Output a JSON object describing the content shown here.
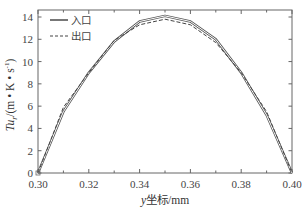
{
  "chart_data": {
    "type": "line",
    "title": "",
    "xlabel": "y坐标/mm",
    "xlabel_italic_prefix": "y",
    "xlabel_rest": "坐标/mm",
    "ylabel": "Tu_r/(m·K·s⁻¹)",
    "ylabel_parts": {
      "main": "Tu",
      "sub": "r",
      "rest": "/(m • K • s",
      "sup": "-1",
      "close": ")"
    },
    "xlim": [
      0.3,
      0.4
    ],
    "ylim": [
      0,
      14
    ],
    "x_ticks": [
      "0.30",
      "0.32",
      "0.34",
      "0.36",
      "0.38",
      "0.40"
    ],
    "y_ticks": [
      "0",
      "2",
      "4",
      "6",
      "8",
      "10",
      "12",
      "14"
    ],
    "grid": false,
    "legend_position": "upper left",
    "x": [
      0.3,
      0.31,
      0.32,
      0.33,
      0.34,
      0.35,
      0.36,
      0.37,
      0.38,
      0.39,
      0.4
    ],
    "series": [
      {
        "name": "入口",
        "style": "solid",
        "color": "#555555",
        "values": [
          0,
          5.5,
          9.0,
          11.8,
          13.6,
          14.1,
          13.6,
          12.0,
          9.0,
          5.2,
          0
        ]
      },
      {
        "name": "出口",
        "style": "dashed",
        "color": "#444444",
        "values": [
          0,
          5.9,
          9.0,
          11.9,
          13.3,
          13.8,
          13.3,
          11.7,
          9.0,
          5.5,
          0
        ]
      }
    ]
  }
}
